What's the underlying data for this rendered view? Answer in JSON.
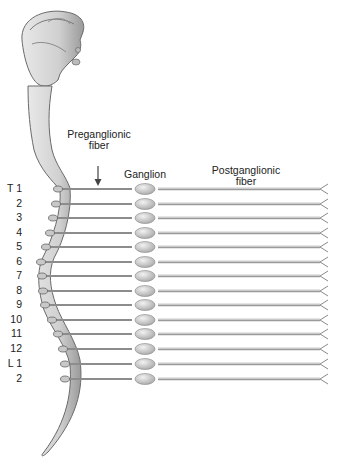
{
  "labels": {
    "preganglionic_line1": "Preganglionic",
    "preganglionic_line2": "fiber",
    "ganglion": "Ganglion",
    "postganglionic_line1": "Postganglionic",
    "postganglionic_line2": "fiber"
  },
  "segments": [
    {
      "label": "T 1",
      "y": 189,
      "cordx": 58
    },
    {
      "label": "2",
      "y": 204,
      "cordx": 56
    },
    {
      "label": "3",
      "y": 218,
      "cordx": 53
    },
    {
      "label": "4",
      "y": 233,
      "cordx": 50
    },
    {
      "label": "5",
      "y": 247,
      "cordx": 46
    },
    {
      "label": "6",
      "y": 262,
      "cordx": 41
    },
    {
      "label": "7",
      "y": 276,
      "cordx": 42
    },
    {
      "label": "8",
      "y": 291,
      "cordx": 43
    },
    {
      "label": "9",
      "y": 305,
      "cordx": 45
    },
    {
      "label": "10",
      "y": 320,
      "cordx": 52
    },
    {
      "label": "11",
      "y": 334,
      "cordx": 58
    },
    {
      "label": "12",
      "y": 349,
      "cordx": 63
    },
    {
      "label": "L 1",
      "y": 364,
      "cordx": 65
    },
    {
      "label": "2",
      "y": 379,
      "cordx": 65
    }
  ],
  "colors": {
    "cord_fill": "#d4d4d4",
    "cord_stroke": "#6a6a6a",
    "fiber": "#9a9a9a",
    "ganglion": "#cfcfcf"
  }
}
